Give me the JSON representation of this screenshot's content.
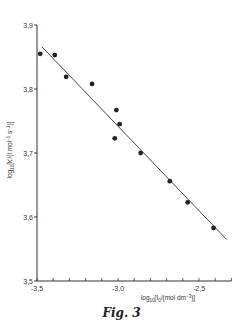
{
  "chart_data": {
    "type": "scatter",
    "title": "",
    "caption": "Fig. 3",
    "xlabel": "log10[I0/(mol dm^-3)]",
    "ylabel": "log10[k'/(l mol^-1 s^-1)]",
    "xlim": [
      -3.5,
      -2.3
    ],
    "ylim": [
      3.5,
      3.9
    ],
    "x_ticks": [
      -3.5,
      -3.0,
      -2.5
    ],
    "x_tick_labels": [
      "-3,5",
      "-3,0",
      "-2,5"
    ],
    "y_ticks": [
      3.5,
      3.6,
      3.7,
      3.8,
      3.9
    ],
    "y_tick_labels": [
      "3,5",
      "3,6",
      "3,7",
      "3,8",
      "3,9"
    ],
    "grid": false,
    "legend": null,
    "series": [
      {
        "name": "measured",
        "marker": "filled-circle",
        "points": [
          {
            "x": -3.48,
            "y": 3.855
          },
          {
            "x": -3.39,
            "y": 3.853
          },
          {
            "x": -3.32,
            "y": 3.819
          },
          {
            "x": -3.16,
            "y": 3.808
          },
          {
            "x": -3.01,
            "y": 3.767
          },
          {
            "x": -2.99,
            "y": 3.745
          },
          {
            "x": -3.02,
            "y": 3.723
          },
          {
            "x": -2.86,
            "y": 3.7
          },
          {
            "x": -2.68,
            "y": 3.656
          },
          {
            "x": -2.57,
            "y": 3.623
          },
          {
            "x": -2.41,
            "y": 3.583
          }
        ]
      },
      {
        "name": "fit line",
        "type": "line",
        "points": [
          {
            "x": -3.47,
            "y": 3.866
          },
          {
            "x": -2.33,
            "y": 3.565
          }
        ]
      }
    ]
  }
}
